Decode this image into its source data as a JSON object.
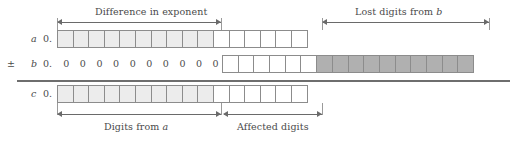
{
  "figure": {
    "title_top_left": "Difference in exponent",
    "title_top_right_prefix": "Lost digits from ",
    "title_top_right_var": "b",
    "title_bottom_left_prefix": "Digits from ",
    "title_bottom_left_var": "a",
    "title_bottom_right": "Affected digits"
  },
  "rows": {
    "a": {
      "sign": "",
      "name": "a",
      "radix": "0.",
      "cells": [
        {
          "kind": "light"
        },
        {
          "kind": "light"
        },
        {
          "kind": "light"
        },
        {
          "kind": "light"
        },
        {
          "kind": "light"
        },
        {
          "kind": "light"
        },
        {
          "kind": "light"
        },
        {
          "kind": "light"
        },
        {
          "kind": "light"
        },
        {
          "kind": "light"
        },
        {
          "kind": "white"
        },
        {
          "kind": "white"
        },
        {
          "kind": "white"
        },
        {
          "kind": "white"
        },
        {
          "kind": "white"
        },
        {
          "kind": "white"
        }
      ]
    },
    "b": {
      "sign": "±",
      "name": "b",
      "radix": "0.",
      "zeros": [
        "0",
        "0",
        "0",
        "0",
        "0",
        "0",
        "0",
        "0",
        "0",
        "0"
      ],
      "cells": [
        {
          "kind": "white"
        },
        {
          "kind": "white"
        },
        {
          "kind": "white"
        },
        {
          "kind": "white"
        },
        {
          "kind": "white"
        },
        {
          "kind": "white"
        },
        {
          "kind": "dark"
        },
        {
          "kind": "dark"
        },
        {
          "kind": "dark"
        },
        {
          "kind": "dark"
        },
        {
          "kind": "dark"
        },
        {
          "kind": "dark"
        },
        {
          "kind": "dark"
        },
        {
          "kind": "dark"
        },
        {
          "kind": "dark"
        },
        {
          "kind": "dark"
        }
      ]
    },
    "c": {
      "sign": "",
      "name": "c",
      "radix": "0.",
      "cells": [
        {
          "kind": "light"
        },
        {
          "kind": "light"
        },
        {
          "kind": "light"
        },
        {
          "kind": "light"
        },
        {
          "kind": "light"
        },
        {
          "kind": "light"
        },
        {
          "kind": "light"
        },
        {
          "kind": "light"
        },
        {
          "kind": "light"
        },
        {
          "kind": "light"
        },
        {
          "kind": "white"
        },
        {
          "kind": "white"
        },
        {
          "kind": "white"
        },
        {
          "kind": "white"
        },
        {
          "kind": "white"
        },
        {
          "kind": "white"
        }
      ]
    }
  },
  "colors": {
    "light_cell": "#ececec",
    "dark_cell": "#b0b0b0",
    "cell_border": "#8c8c8c",
    "rule": "#6e6e6e",
    "arrow": "#6a6a6a",
    "text": "#4a4a4a"
  },
  "measurements": {
    "difference_in_exponent_digits": 10,
    "affected_digits": 6,
    "lost_digits_from_b": 10,
    "digits_from_a": 10
  }
}
